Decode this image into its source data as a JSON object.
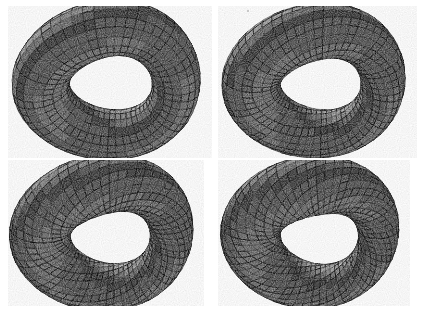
{
  "figure": {
    "title": "Torus deformation sequence",
    "description": "Four grayscale wireframe renderings of a torus progressively twisting into a self-intersecting surface",
    "render_style": "halftone-dithered scanned line drawing",
    "background_color": "#ffffff",
    "mesh_color": "#000000",
    "layout": {
      "type": "grid",
      "rows": 2,
      "columns": 2,
      "width": 428,
      "height": 309
    },
    "artifacts": [
      {
        "name": "scan-speck",
        "x": 247,
        "y": 10,
        "size": 2
      }
    ]
  },
  "panels": [
    {
      "id": "panel-top-left",
      "label": "Stage 1",
      "position": {
        "x": 8,
        "y": 6,
        "width": 206,
        "height": 152
      },
      "view": {
        "cx": 104,
        "cy": 74,
        "scale": 78,
        "yaw": -28,
        "pitch": 58,
        "roll": 4
      },
      "surface": {
        "name": "twisted-torus",
        "major_radius": 1.0,
        "minor_radius": 0.42,
        "twist": 0.0,
        "shear": 0.34,
        "pinch": 0.3,
        "lift": 0.4,
        "u_segments": 52,
        "v_segments": 18,
        "hole_size": "large-open"
      },
      "shading": {
        "light": [
          -0.36,
          -0.58,
          0.73
        ],
        "ambient": 0.3,
        "diffuse": 0.7,
        "gamma": 0.95
      }
    },
    {
      "id": "panel-top-right",
      "label": "Stage 2",
      "position": {
        "x": 218,
        "y": 6,
        "width": 206,
        "height": 152
      },
      "view": {
        "cx": 104,
        "cy": 74,
        "scale": 76,
        "yaw": -20,
        "pitch": 60,
        "roll": 2
      },
      "surface": {
        "name": "twisted-torus",
        "major_radius": 1.0,
        "minor_radius": 0.44,
        "twist": 0.46,
        "shear": 0.4,
        "pinch": 0.46,
        "lift": 0.58,
        "u_segments": 56,
        "v_segments": 19,
        "hole_size": "medium-spiral"
      },
      "shading": {
        "light": [
          -0.34,
          -0.6,
          0.72
        ],
        "ambient": 0.28,
        "diffuse": 0.72,
        "gamma": 0.95
      }
    },
    {
      "id": "panel-bottom-left",
      "label": "Stage 3",
      "position": {
        "x": 8,
        "y": 160,
        "width": 206,
        "height": 146
      },
      "view": {
        "cx": 104,
        "cy": 72,
        "scale": 76,
        "yaw": -12,
        "pitch": 63,
        "roll": 1
      },
      "surface": {
        "name": "twisted-torus",
        "major_radius": 1.0,
        "minor_radius": 0.46,
        "twist": 0.86,
        "shear": 0.44,
        "pinch": 0.58,
        "lift": 0.72,
        "u_segments": 58,
        "v_segments": 20,
        "hole_size": "small-vortex"
      },
      "shading": {
        "light": [
          -0.32,
          -0.62,
          0.71
        ],
        "ambient": 0.26,
        "diffuse": 0.74,
        "gamma": 0.93
      }
    },
    {
      "id": "panel-bottom-right",
      "label": "Stage 4",
      "position": {
        "x": 218,
        "y": 160,
        "width": 206,
        "height": 146
      },
      "view": {
        "cx": 104,
        "cy": 72,
        "scale": 74,
        "yaw": -4,
        "pitch": 65,
        "roll": 0
      },
      "surface": {
        "name": "twisted-torus",
        "major_radius": 1.0,
        "minor_radius": 0.47,
        "twist": 1.22,
        "shear": 0.48,
        "pinch": 0.66,
        "lift": 0.86,
        "u_segments": 60,
        "v_segments": 20,
        "hole_size": "tight-vortex"
      },
      "shading": {
        "light": [
          -0.3,
          -0.64,
          0.7
        ],
        "ambient": 0.25,
        "diffuse": 0.75,
        "gamma": 0.92
      }
    }
  ]
}
